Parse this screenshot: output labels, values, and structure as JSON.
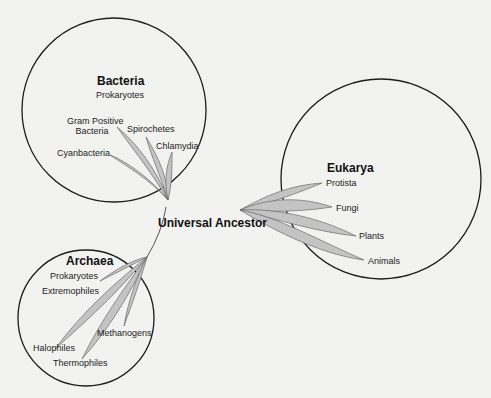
{
  "diagram": {
    "type": "phylogenetic-tree",
    "root": {
      "label": "Universal Ancestor"
    },
    "domains": [
      {
        "name": "Bacteria",
        "subtitle": "Prokaryotes",
        "branches": [
          "Gram Positive Bacteria",
          "Spirochetes",
          "Chlamydia",
          "Cyanbacteria"
        ]
      },
      {
        "name": "Eukarya",
        "subtitle": "",
        "branches": [
          "Protista",
          "Fungi",
          "Plants",
          "Animals"
        ]
      },
      {
        "name": "Archaea",
        "subtitle": "Prokaryotes",
        "branches": [
          "Extremophiles",
          "Methanogens",
          "Halophiles",
          "Thermophiles"
        ]
      }
    ]
  },
  "labels": {
    "root": "Universal Ancestor",
    "bacteria": {
      "title": "Bacteria",
      "subtitle": "Prokaryotes",
      "gram_positive_line1": "Gram Positive",
      "gram_positive_line2": "Bacteria",
      "spirochetes": "Spirochetes",
      "chlamydia": "Chlamydia",
      "cyanbacteria": "Cyanbacteria"
    },
    "eukarya": {
      "title": "Eukarya",
      "protista": "Protista",
      "fungi": "Fungi",
      "plants": "Plants",
      "animals": "Animals"
    },
    "archaea": {
      "title": "Archaea",
      "subtitle": "Prokaryotes",
      "extremophiles": "Extremophiles",
      "methanogens": "Methanogens",
      "halophiles": "Halophiles",
      "thermophiles": "Thermophiles"
    }
  },
  "colors": {
    "background": "#f2f2f0",
    "circle_stroke": "#1c1c1c",
    "leaf_fill": "#c4c4c4",
    "leaf_stroke": "#6a6a6a",
    "text": "#1a1a1a"
  }
}
